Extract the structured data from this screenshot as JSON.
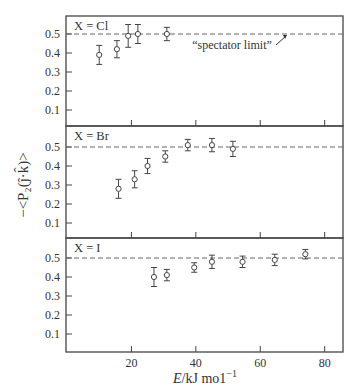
{
  "chart_data": [
    {
      "type": "scatter",
      "panel_label": "X = Cl",
      "annotation": "“spectator limit”",
      "reference_line": 0.5,
      "x": [
        10,
        15.5,
        19,
        22,
        31
      ],
      "y": [
        0.39,
        0.42,
        0.49,
        0.5,
        0.5
      ],
      "yerr": [
        0.05,
        0.045,
        0.06,
        0.05,
        0.035
      ],
      "ylim": [
        0,
        0.58
      ],
      "yticks": [
        0.1,
        0.2,
        0.3,
        0.4,
        0.5
      ]
    },
    {
      "type": "scatter",
      "panel_label": "X = Br",
      "reference_line": 0.5,
      "x": [
        16,
        21,
        25,
        30.5,
        37.5,
        45,
        51.5
      ],
      "y": [
        0.28,
        0.33,
        0.4,
        0.45,
        0.51,
        0.51,
        0.49
      ],
      "yerr": [
        0.05,
        0.045,
        0.04,
        0.03,
        0.03,
        0.035,
        0.04
      ],
      "ylim": [
        0,
        0.58
      ],
      "yticks": [
        0.1,
        0.2,
        0.3,
        0.4,
        0.5
      ]
    },
    {
      "type": "scatter",
      "panel_label": "X = I",
      "reference_line": 0.5,
      "x": [
        27,
        31,
        39.5,
        45,
        54.5,
        64.5,
        74
      ],
      "y": [
        0.4,
        0.41,
        0.45,
        0.48,
        0.48,
        0.49,
        0.52
      ],
      "yerr": [
        0.05,
        0.03,
        0.025,
        0.035,
        0.03,
        0.03,
        0.025
      ],
      "ylim": [
        0,
        0.58
      ],
      "yticks": [
        0.1,
        0.2,
        0.3,
        0.4,
        0.5
      ]
    }
  ],
  "axes": {
    "xlabel": "E/kJ mol⁻¹",
    "xlabel_italic": "E",
    "xlabel_rest": "/kJ mo1",
    "xlabel_sup": "−1",
    "ylabel": "−<P₂(ĵ·k̂)>",
    "xlim": [
      0,
      86
    ],
    "xticks": [
      20,
      40,
      60,
      80
    ],
    "xtick_labels": [
      "20",
      "40",
      "60",
      "80"
    ],
    "ytick_labels": [
      "0.1",
      "0.2",
      "0.3",
      "0.4",
      "0.5"
    ]
  }
}
